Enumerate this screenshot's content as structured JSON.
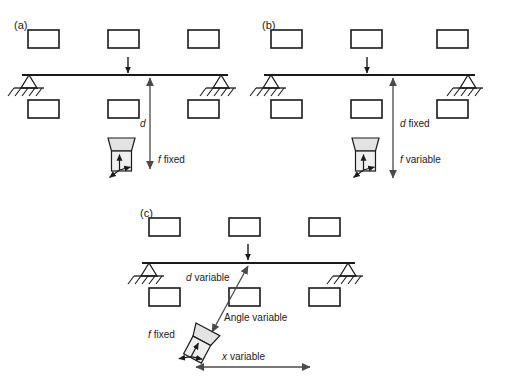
{
  "figure": {
    "background_color": "#ffffff",
    "line_color": "#1a1a1a",
    "device_fill": "#e3e3e3",
    "dim_line_color": "#555555",
    "panels": [
      {
        "id": "a",
        "label": "(a)",
        "labels": {
          "distance": "d",
          "focus": "f fixed",
          "focus_symbol": "f",
          "focus_word": "fixed"
        },
        "notes": "distance d with double arrow, focal setting fixed"
      },
      {
        "id": "b",
        "label": "(b)",
        "labels": {
          "distance": "d fixed",
          "distance_symbol": "d",
          "distance_word": "fixed",
          "focus": "f variable",
          "focus_symbol": "f",
          "focus_word": "variable"
        },
        "notes": "distance d fixed, focal setting variable"
      },
      {
        "id": "c",
        "label": "(c)",
        "labels": {
          "distance": "d variable",
          "distance_symbol": "d",
          "distance_word": "variable",
          "angle": "Angle variable",
          "focus": "f fixed",
          "focus_symbol": "f",
          "focus_word": "fixed",
          "offset": "x variable",
          "offset_symbol": "x",
          "offset_word": "variable"
        },
        "notes": "oblique view: d variable, angle variable, f fixed, x variable"
      }
    ],
    "elements": {
      "beam": "horizontal beam",
      "support": "pin support with ground hatching",
      "load_arrow": "downward point load arrow",
      "block": "rectangular block",
      "device": "sensor device: trapezoid lens over rectangular body with 3D axis arrows"
    }
  }
}
